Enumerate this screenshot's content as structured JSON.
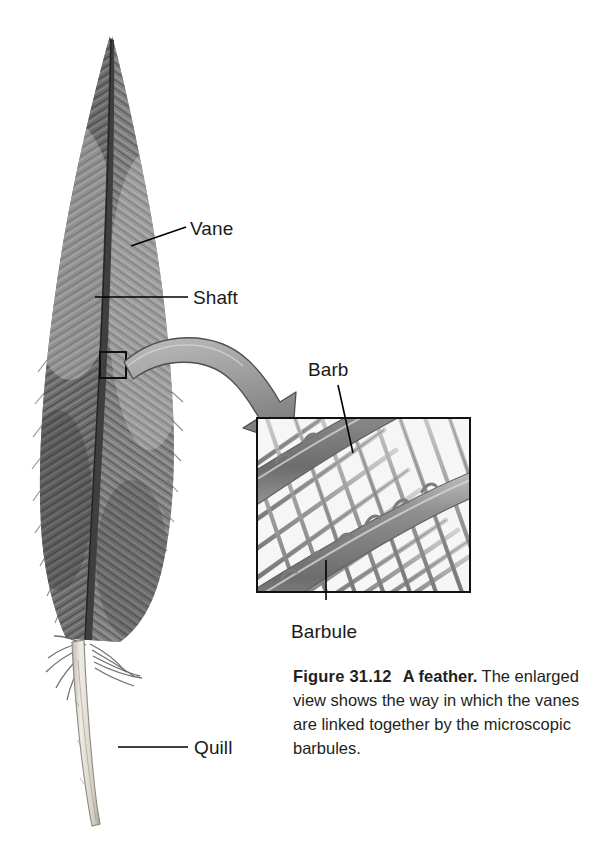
{
  "figure": {
    "number": "Figure 31.12",
    "title": "A feather.",
    "body": "The enlarged view shows the way in which the vanes are linked together by the microscopic barbules.",
    "alt": "Pencil-style illustration of a bird feather with an enlarged inset showing barbs and interlocking barbules"
  },
  "labels": {
    "vane": "Vane",
    "shaft": "Shaft",
    "barb": "Barb",
    "barbule": "Barbule",
    "quill": "Quill"
  },
  "colors": {
    "background": "#ffffff",
    "label_text": "#1a1a1a",
    "caption_text": "#231f20",
    "leader_line": "#000000",
    "inset_border": "#111111",
    "arrow_fill": "#9a9a9a",
    "arrow_stroke": "#4a4a4a",
    "feather_vane_dark": "#5f5f5f",
    "feather_vane_light": "#b9b9b9",
    "feather_shaft": "#3a3a3a",
    "quill_pale": "#e2ded6",
    "barb_fill": "#8f8f8f",
    "barbule_fill": "#a5a5a5"
  },
  "inset": {
    "x": 257,
    "y": 418,
    "width": 213,
    "height": 174,
    "border_width": 2
  },
  "source_square": {
    "x": 100,
    "y": 352,
    "width": 26,
    "height": 26
  },
  "canvas": {
    "width": 612,
    "height": 854
  }
}
